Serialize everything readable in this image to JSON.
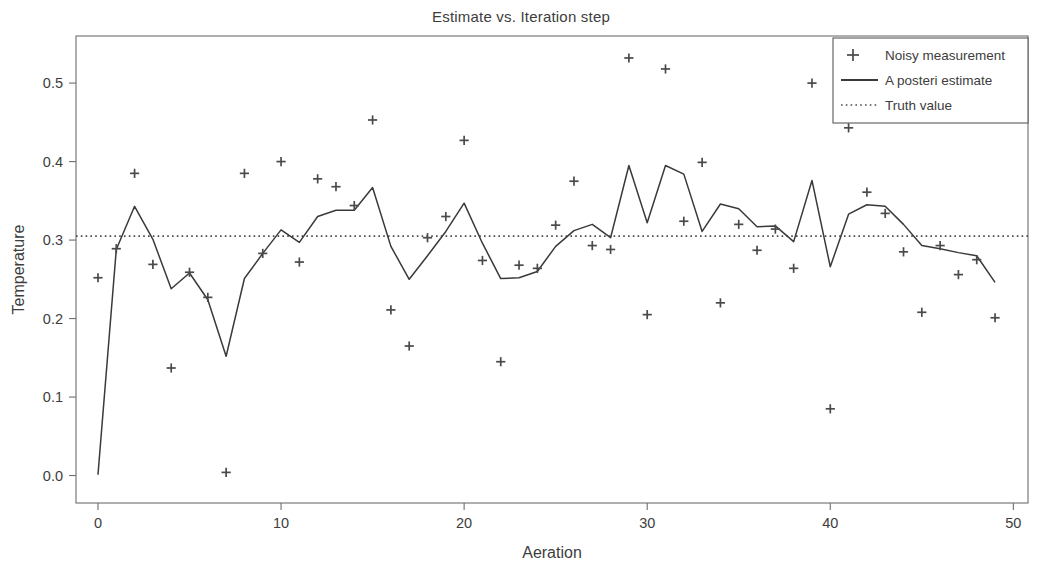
{
  "chart_data": {
    "type": "scatter",
    "title": "Estimate vs. Iteration step",
    "xlabel": "Aeration",
    "ylabel": "Temperature",
    "xlim": [
      -1.2,
      50.8
    ],
    "ylim": [
      -0.035,
      0.56
    ],
    "xticks": [
      0,
      10,
      20,
      30,
      40,
      50
    ],
    "yticks": [
      0.0,
      0.1,
      0.2,
      0.3,
      0.4,
      0.5
    ],
    "xticklabels": [
      "0",
      "10",
      "20",
      "30",
      "40",
      "50"
    ],
    "yticklabels": [
      "0.0",
      "0.1",
      "0.2",
      "0.3",
      "0.4",
      "0.5"
    ],
    "grid": false,
    "legend_position": "upper right",
    "colors": {
      "measurement": "#4a4a4a",
      "estimate": "#3a3a3a",
      "truth": "#4a4a4a",
      "frame": "#6e6e6e"
    },
    "x": [
      0,
      1,
      2,
      3,
      4,
      5,
      6,
      7,
      8,
      9,
      10,
      11,
      12,
      13,
      14,
      15,
      16,
      17,
      18,
      19,
      20,
      21,
      22,
      23,
      24,
      25,
      26,
      27,
      28,
      29,
      30,
      31,
      32,
      33,
      34,
      35,
      36,
      37,
      38,
      39,
      40,
      41,
      42,
      43,
      44,
      45,
      46,
      47,
      48,
      49
    ],
    "series": [
      {
        "name": "Noisy measurement",
        "marker": "+",
        "style": "points",
        "values": [
          0.252,
          0.289,
          0.385,
          0.269,
          0.137,
          0.259,
          0.227,
          0.004,
          0.385,
          0.283,
          0.4,
          0.272,
          0.378,
          0.368,
          0.344,
          0.453,
          0.211,
          0.165,
          0.303,
          0.33,
          0.427,
          0.274,
          0.145,
          0.268,
          0.264,
          0.319,
          0.375,
          0.293,
          0.288,
          0.532,
          0.205,
          0.518,
          0.324,
          0.399,
          0.22,
          0.32,
          0.287,
          0.314,
          0.264,
          0.5,
          0.085,
          0.443,
          0.361,
          0.334,
          0.285,
          0.208,
          0.293,
          0.256,
          0.275,
          0.201
        ]
      },
      {
        "name": "A posteri estimate",
        "marker": "line",
        "style": "line",
        "values": [
          0.001,
          0.288,
          0.343,
          0.301,
          0.238,
          0.258,
          0.224,
          0.152,
          0.251,
          0.283,
          0.313,
          0.297,
          0.33,
          0.338,
          0.338,
          0.367,
          0.292,
          0.25,
          0.28,
          0.311,
          0.347,
          0.296,
          0.251,
          0.252,
          0.26,
          0.292,
          0.312,
          0.32,
          0.303,
          0.395,
          0.322,
          0.395,
          0.384,
          0.311,
          0.346,
          0.34,
          0.317,
          0.318,
          0.298,
          0.376,
          0.266,
          0.333,
          0.345,
          0.343,
          0.32,
          0.293,
          0.289,
          0.284,
          0.28,
          0.246
        ]
      },
      {
        "name": "Truth value",
        "marker": "dotted",
        "style": "hline",
        "value": 0.305
      }
    ]
  },
  "legend": {
    "entries": [
      {
        "label": "Noisy measurement",
        "glyph": "plus-marker"
      },
      {
        "label": "A posteri estimate",
        "glyph": "solid-line"
      },
      {
        "label": "Truth value",
        "glyph": "dotted-line"
      }
    ]
  }
}
